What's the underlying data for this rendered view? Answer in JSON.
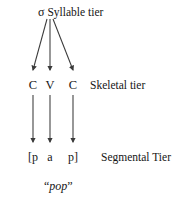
{
  "diagram": {
    "background_color": "#ffffff",
    "line_color": "#3a3a3a",
    "text_color": "#161616",
    "tiers": {
      "syllable": {
        "node_symbol": "σ",
        "label": "Syllable tier"
      },
      "skeletal": {
        "label": "Skeletal tier",
        "slots": [
          "C",
          "V",
          "C"
        ]
      },
      "segmental": {
        "label": "Segmental Tier",
        "slots": [
          "[p",
          "a",
          "p]"
        ]
      }
    },
    "caption": {
      "open_quote": "“",
      "word": "pop",
      "close_quote": "”"
    }
  }
}
